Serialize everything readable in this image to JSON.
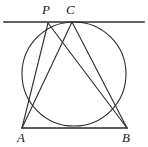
{
  "figure": {
    "kind": "geometry-diagram",
    "width": 148,
    "height": 147,
    "background_color": "#ffffff",
    "stroke_color": "#2b2b2b",
    "label_color": "#1a1a1a"
  },
  "labels": {
    "p": "P",
    "c": "C",
    "a": "A",
    "b": "B"
  },
  "label_positions": {
    "p": {
      "x": 42,
      "y": 3
    },
    "c": {
      "x": 66,
      "y": 3
    },
    "a": {
      "x": 17,
      "y": 131
    },
    "b": {
      "x": 122,
      "y": 131
    }
  },
  "points": {
    "P": {
      "x": 48,
      "y": 23
    },
    "C": {
      "x": 72,
      "y": 22
    },
    "A": {
      "x": 22,
      "y": 128
    },
    "B": {
      "x": 127,
      "y": 128
    }
  },
  "circle": {
    "center_x": 74,
    "center_y": 74,
    "radius": 52,
    "stroke_width": 1.1
  },
  "tangent_line": {
    "x1": 4,
    "y1": 22,
    "x2": 144,
    "y2": 22,
    "stroke_width": 1.6
  },
  "segments": [
    {
      "name": "chord-AB",
      "x1": 22,
      "y1": 128,
      "x2": 127,
      "y2": 128,
      "stroke_width": 1.6
    },
    {
      "name": "segment-PA",
      "x1": 48,
      "y1": 23,
      "x2": 22,
      "y2": 128,
      "stroke_width": 1.1
    },
    {
      "name": "segment-PB",
      "x1": 48,
      "y1": 23,
      "x2": 127,
      "y2": 128,
      "stroke_width": 1.1
    },
    {
      "name": "segment-CA",
      "x1": 72,
      "y1": 22,
      "x2": 22,
      "y2": 128,
      "stroke_width": 1.1
    },
    {
      "name": "segment-CB",
      "x1": 72,
      "y1": 22,
      "x2": 127,
      "y2": 128,
      "stroke_width": 1.1
    }
  ]
}
